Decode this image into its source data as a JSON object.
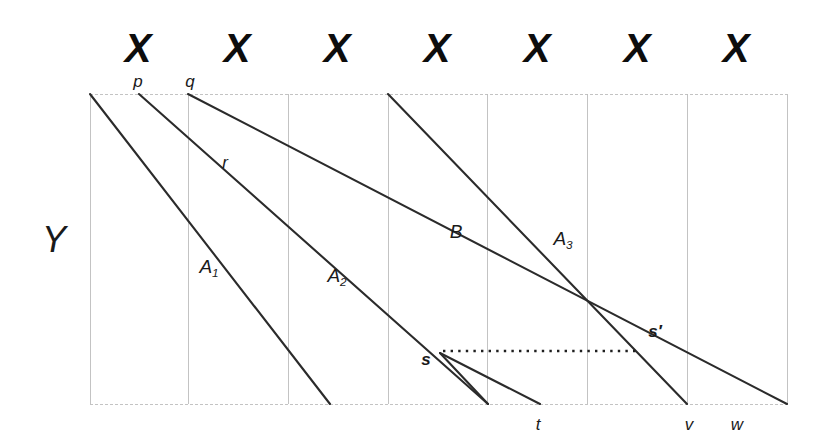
{
  "figure": {
    "axes": {
      "y_axis_label": "Y",
      "x_tick_symbol": "X",
      "x_tick_count": 7
    },
    "x_ticks": [
      {
        "label": "X",
        "cx": 138,
        "cy": 48
      },
      {
        "label": "X",
        "cx": 237,
        "cy": 48
      },
      {
        "label": "X",
        "cx": 337,
        "cy": 48
      },
      {
        "label": "X",
        "cx": 437,
        "cy": 48
      },
      {
        "label": "X",
        "cx": 537,
        "cy": 48
      },
      {
        "label": "X",
        "cx": 637,
        "cy": 48
      },
      {
        "label": "X",
        "cx": 736,
        "cy": 48
      }
    ],
    "point_labels": [
      {
        "name": "p",
        "text": "p",
        "x": 138,
        "y": 81,
        "bold": false
      },
      {
        "name": "q",
        "text": "q",
        "x": 190,
        "y": 81,
        "bold": false
      },
      {
        "name": "r",
        "text": "r",
        "x": 225,
        "y": 162,
        "bold": false
      },
      {
        "name": "s",
        "text": "s",
        "x": 426,
        "y": 359,
        "bold": true
      },
      {
        "name": "s-prime",
        "text": "s′",
        "x": 655,
        "y": 331,
        "bold": true
      },
      {
        "name": "t",
        "text": "t",
        "x": 538,
        "y": 424,
        "bold": false
      },
      {
        "name": "v",
        "text": "v",
        "x": 689,
        "y": 424,
        "bold": false
      },
      {
        "name": "w",
        "text": "w",
        "x": 737,
        "y": 424,
        "bold": false
      }
    ],
    "curve_labels": [
      {
        "name": "A1",
        "base": "A",
        "sub": "1",
        "x": 209,
        "y": 268
      },
      {
        "name": "A2",
        "base": "A",
        "sub": "2",
        "x": 337,
        "y": 277
      },
      {
        "name": "A3",
        "base": "A",
        "sub": "3",
        "x": 563,
        "y": 240
      },
      {
        "name": "B",
        "base": "B",
        "sub": "",
        "x": 456,
        "y": 231
      }
    ],
    "y_label_pos": {
      "x": 54,
      "y": 240
    }
  },
  "chart_data": {
    "type": "line",
    "title": "",
    "xlabel": "X",
    "ylabel": "Y",
    "grid": true,
    "legend": "none",
    "plot_area": {
      "left": 90,
      "top": 94,
      "right": 787,
      "bottom": 404
    },
    "gridlines_x": [
      90,
      188,
      288,
      388,
      487,
      587,
      687,
      787
    ],
    "gridlines_y": [
      94,
      404
    ],
    "style": {
      "line_color": "#2b2b2b",
      "line_width": 2.1,
      "grid_color": "#bdbdbd",
      "grid_width": 0.9,
      "dotted_color": "#1f1f1f"
    },
    "series": [
      {
        "name": "A1",
        "label": "A₁",
        "kind": "solid",
        "points": [
          [
            90,
            94
          ],
          [
            330,
            404
          ]
        ]
      },
      {
        "name": "A2",
        "label": "A₂",
        "kind": "solid",
        "points": [
          [
            139,
            94
          ],
          [
            488,
            404
          ]
        ]
      },
      {
        "name": "B",
        "label": "B",
        "kind": "solid",
        "points": [
          [
            188,
            94
          ],
          [
            787,
            404
          ]
        ]
      },
      {
        "name": "A3",
        "label": "A₃",
        "kind": "solid",
        "points": [
          [
            388,
            94
          ],
          [
            687,
            404
          ]
        ]
      },
      {
        "name": "s-to-t",
        "label": "",
        "kind": "solid",
        "points": [
          [
            440,
            353
          ],
          [
            540,
            404
          ]
        ]
      },
      {
        "name": "s-to-q-drop",
        "label": "",
        "kind": "solid",
        "points": [
          [
            440,
            353
          ],
          [
            488,
            404
          ]
        ]
      },
      {
        "name": "dotted-s-to-sprime",
        "label": "",
        "kind": "dotted",
        "points": [
          [
            443,
            351
          ],
          [
            640,
            351
          ]
        ]
      }
    ],
    "intersections": [
      {
        "name": "r",
        "x": 240,
        "y": 150
      },
      {
        "name": "s",
        "x": 440,
        "y": 353
      },
      {
        "name": "s-prime",
        "x": 640,
        "y": 352
      }
    ],
    "x_tick_values": [
      "X",
      "X",
      "X",
      "X",
      "X",
      "X",
      "X"
    ],
    "annotated_x_positions": [
      {
        "label": "p",
        "x": 139
      },
      {
        "label": "q",
        "x": 188
      },
      {
        "label": "t",
        "x": 540
      },
      {
        "label": "v",
        "x": 687
      },
      {
        "label": "w",
        "x": 740
      }
    ]
  }
}
